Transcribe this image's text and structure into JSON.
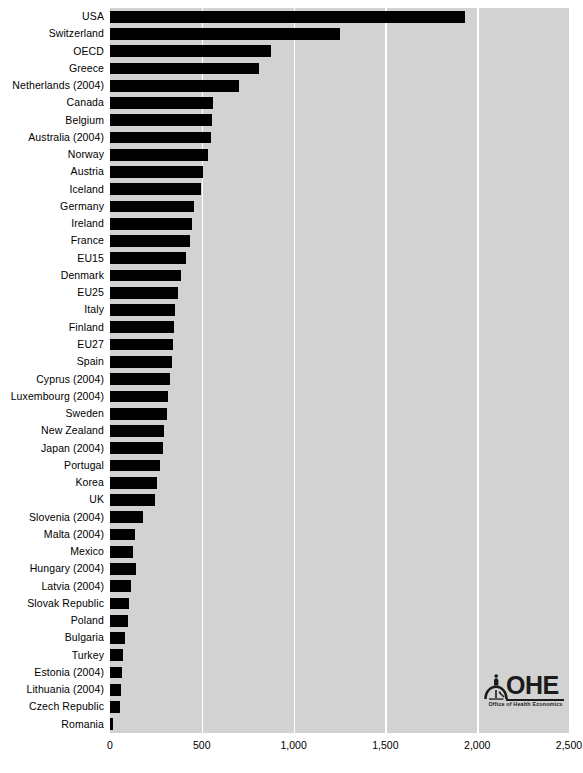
{
  "chart_data": {
    "type": "bar",
    "orientation": "horizontal",
    "title": "",
    "xlabel": "",
    "ylabel": "",
    "xlim": [
      0,
      2500
    ],
    "grid": true,
    "legend": false,
    "xticks": [
      "0",
      "500",
      "1,000",
      "1,500",
      "2,000",
      "2,500"
    ],
    "xtick_values": [
      0,
      500,
      1000,
      1500,
      2000,
      2500
    ],
    "categories": [
      "USA",
      "Switzerland",
      "OECD",
      "Greece",
      "Netherlands (2004)",
      "Canada",
      "Belgium",
      "Australia (2004)",
      "Norway",
      "Austria",
      "Iceland",
      "Germany",
      "Ireland",
      "France",
      "EU15",
      "Denmark",
      "EU25",
      "Italy",
      "Finland",
      "EU27",
      "Spain",
      "Cyprus (2004)",
      "Luxembourg (2004)",
      "Sweden",
      "New Zealand",
      "Japan (2004)",
      "Portugal",
      "Korea",
      "UK",
      "Slovenia (2004)",
      "Malta (2004)",
      "Mexico",
      "Hungary (2004)",
      "Latvia (2004)",
      "Slovak Republic",
      "Poland",
      "Bulgaria",
      "Turkey",
      "Estonia (2004)",
      "Lithuania (2004)",
      "Czech Republic",
      "Romania"
    ],
    "values": [
      1935,
      1250,
      876,
      810,
      700,
      560,
      558,
      548,
      532,
      505,
      493,
      460,
      449,
      438,
      416,
      384,
      373,
      356,
      351,
      345,
      340,
      329,
      318,
      312,
      295,
      290,
      274,
      258,
      247,
      181,
      137,
      126,
      142,
      115,
      104,
      99,
      82,
      71,
      66,
      60,
      55,
      16
    ],
    "series_name": "",
    "bar_color": "#000000",
    "plot_background": "#d2d2d2",
    "gridline_color": "#ffffff"
  },
  "logo": {
    "name": "OHE",
    "tagline": "Office of Health Economics"
  }
}
